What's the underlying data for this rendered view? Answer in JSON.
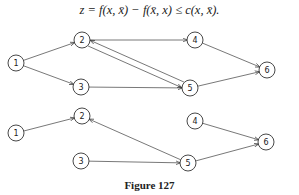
{
  "formula": "z = f(x, x̄) − f(x̄, x) ≤ c(x, x̄).",
  "caption": "Figure 127",
  "graphs": [
    {
      "name": "top-graph",
      "nodes": [
        {
          "id": "1",
          "x": 16,
          "y": 63
        },
        {
          "id": "2",
          "x": 82,
          "y": 40
        },
        {
          "id": "3",
          "x": 81,
          "y": 87
        },
        {
          "id": "4",
          "x": 195,
          "y": 40
        },
        {
          "id": "5",
          "x": 190,
          "y": 88
        },
        {
          "id": "6",
          "x": 267,
          "y": 70
        }
      ],
      "edges": [
        [
          "1",
          "2",
          0
        ],
        [
          "1",
          "3",
          0
        ],
        [
          "2",
          "4",
          0
        ],
        [
          "2",
          "5",
          3
        ],
        [
          "5",
          "2",
          3
        ],
        [
          "3",
          "5",
          0
        ],
        [
          "4",
          "6",
          0
        ],
        [
          "5",
          "6",
          0
        ]
      ]
    },
    {
      "name": "bottom-graph",
      "nodes": [
        {
          "id": "1",
          "x": 16,
          "y": 133
        },
        {
          "id": "2",
          "x": 82,
          "y": 116
        },
        {
          "id": "3",
          "x": 81,
          "y": 161
        },
        {
          "id": "4",
          "x": 195,
          "y": 121
        },
        {
          "id": "5",
          "x": 188,
          "y": 163
        },
        {
          "id": "6",
          "x": 266,
          "y": 142
        }
      ],
      "edges": [
        [
          "1",
          "2",
          0
        ],
        [
          "5",
          "2",
          0
        ],
        [
          "3",
          "5",
          0
        ],
        [
          "4",
          "6",
          0
        ],
        [
          "5",
          "6",
          0
        ]
      ]
    }
  ]
}
